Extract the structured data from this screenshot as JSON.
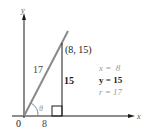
{
  "diagram": {
    "axes": {
      "x_label": "x",
      "y_label": "y",
      "origin_label": "0"
    },
    "point": {
      "label": "(8, 15)",
      "x": 8,
      "y": 15
    },
    "sides": {
      "hypotenuse": "17",
      "opposite": "15",
      "adjacent": "8"
    },
    "angle_label": "θ",
    "equations": [
      {
        "text": "x =  8",
        "emphasis": false
      },
      {
        "text": "y = 15",
        "emphasis": true
      },
      {
        "text": "r = 17",
        "emphasis": false
      }
    ],
    "colors": {
      "axis": "#1a1a1a",
      "hypotenuse": "#8a8a8a",
      "faded_text": "#9a9a9a",
      "text": "#1a1a1a"
    }
  }
}
